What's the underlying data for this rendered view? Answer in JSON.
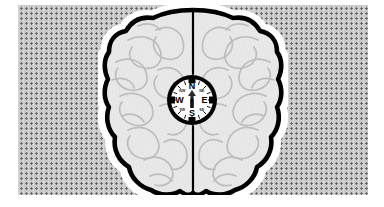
{
  "illustration": {
    "title": "Brain with compass rose",
    "subject": "human brain, superior (top-down) view with a compass at center",
    "background": {
      "style": "stippled dotted panel",
      "panel_color": "#c9c9c9",
      "dot_color": "#5f5f5f",
      "dot_spacing_px": 5,
      "margin_color": "#ffffff"
    },
    "brain": {
      "outline_color": "#000000",
      "halo_color": "#ffffff",
      "fill_color": "#e9e9e9",
      "gyri_line_color": "#b9b9b9",
      "fissure_label": "longitudinal fissure",
      "hemispheres": [
        "left hemisphere",
        "right hemisphere"
      ]
    },
    "compass": {
      "rim_color": "#000000",
      "face_color": "#ffffff",
      "needle_color": "#2b2b2b",
      "cardinal_points": [
        {
          "label": "N",
          "angle_deg": 0
        },
        {
          "label": "E",
          "angle_deg": 90
        },
        {
          "label": "S",
          "angle_deg": 180
        },
        {
          "label": "W",
          "angle_deg": 270
        }
      ],
      "intercardinal_points": [
        {
          "label": "NW",
          "angle_deg": 315
        },
        {
          "label": "NE",
          "angle_deg": 45
        },
        {
          "label": "SE",
          "angle_deg": 135
        },
        {
          "label": "SW",
          "angle_deg": 225
        }
      ],
      "needle_points_to": "N"
    }
  }
}
